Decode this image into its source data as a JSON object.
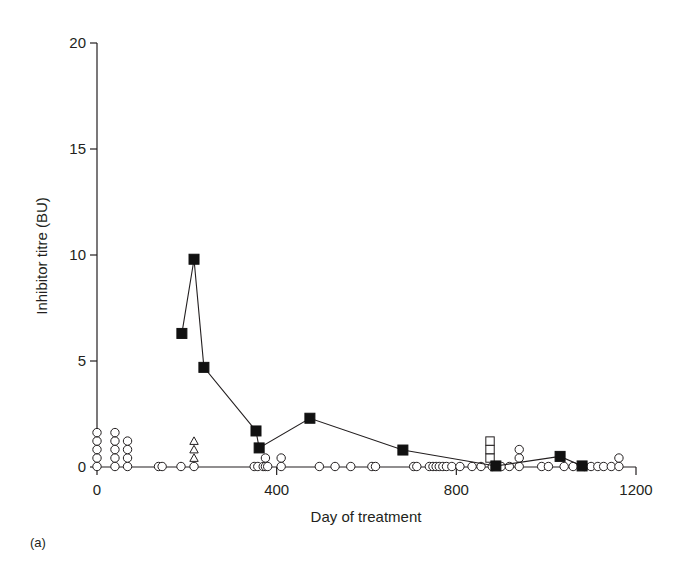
{
  "chart_data": {
    "type": "scatter",
    "title": "",
    "panel_label": "(a)",
    "xlabel": "Day of treatment",
    "ylabel": "Inhibitor titre (BU)",
    "xlim": [
      0,
      1200
    ],
    "ylim": [
      0,
      20
    ],
    "xticks": [
      0,
      400,
      800,
      1200
    ],
    "yticks": [
      0,
      5,
      10,
      15,
      20
    ],
    "grid": false,
    "legend": "none",
    "series": [
      {
        "name": "filled squares (connected)",
        "marker": "filled-square",
        "connected": true,
        "points": [
          [
            189,
            6.3
          ],
          [
            216,
            9.8
          ],
          [
            238,
            4.7
          ],
          [
            354,
            1.7
          ],
          [
            361,
            0.9
          ],
          [
            474,
            2.3
          ],
          [
            681,
            0.8
          ],
          [
            888,
            0.05
          ],
          [
            1031,
            0.5
          ],
          [
            1080,
            0.05
          ]
        ]
      },
      {
        "name": "open circles",
        "marker": "open-circle",
        "connected": false,
        "stack_step": 0.4,
        "stacks": [
          [
            0,
            5
          ],
          [
            40,
            5
          ],
          [
            68,
            4
          ],
          [
            137,
            1
          ],
          [
            145,
            1
          ],
          [
            187,
            1
          ],
          [
            216,
            1
          ],
          [
            350,
            1
          ],
          [
            358,
            1
          ],
          [
            370,
            1
          ],
          [
            375,
            2
          ],
          [
            380,
            1
          ],
          [
            410,
            2
          ],
          [
            495,
            1
          ],
          [
            530,
            1
          ],
          [
            565,
            1
          ],
          [
            612,
            1
          ],
          [
            620,
            1
          ],
          [
            705,
            1
          ],
          [
            712,
            1
          ],
          [
            740,
            1
          ],
          [
            748,
            1
          ],
          [
            755,
            1
          ],
          [
            762,
            1
          ],
          [
            770,
            1
          ],
          [
            778,
            1
          ],
          [
            790,
            1
          ],
          [
            808,
            1
          ],
          [
            835,
            1
          ],
          [
            855,
            1
          ],
          [
            880,
            1
          ],
          [
            900,
            1
          ],
          [
            918,
            1
          ],
          [
            940,
            3
          ],
          [
            990,
            1
          ],
          [
            1005,
            1
          ],
          [
            1040,
            1
          ],
          [
            1060,
            1
          ],
          [
            1085,
            1
          ],
          [
            1100,
            1
          ],
          [
            1115,
            1
          ],
          [
            1128,
            1
          ],
          [
            1145,
            1
          ],
          [
            1162,
            2
          ]
        ]
      },
      {
        "name": "open triangles",
        "marker": "open-triangle",
        "connected": false,
        "stack_step": 0.4,
        "stacks": [
          [
            216,
            3
          ]
        ],
        "base_offset": 1
      },
      {
        "name": "open squares",
        "marker": "open-square",
        "connected": false,
        "stack_step": 0.4,
        "stacks": [
          [
            875,
            3
          ]
        ],
        "base_offset": 1
      }
    ]
  }
}
